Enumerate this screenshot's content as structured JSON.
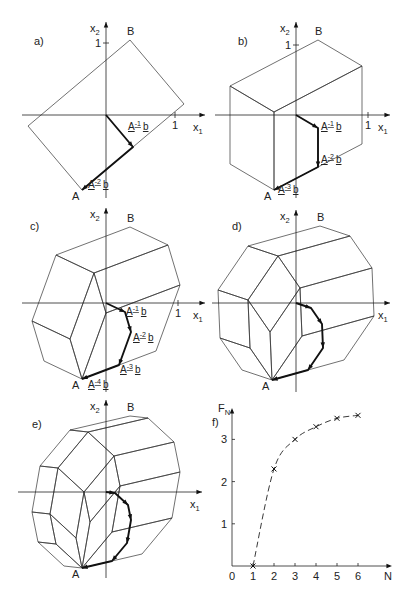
{
  "figure": {
    "panels": [
      {
        "id": "a",
        "label": "a)",
        "origin": [
          106,
          115
        ],
        "label_pos": [
          34,
          45
        ],
        "axes": {
          "xmin": 22,
          "xmax": 205,
          "ymin": 22,
          "ymax": 198,
          "x_label": "x1",
          "y_label": "x2",
          "tick_x": [
            175,
            "1"
          ],
          "tick_y": [
            43,
            "1"
          ]
        },
        "generators": [
          [
            27,
            32
          ],
          [
            -51,
            43
          ]
        ],
        "point_A": "A",
        "point_B": "B",
        "annotations": [
          {
            "text": "A",
            "sup": "-1",
            "tail": "b",
            "pos": [
              128,
              130
            ]
          },
          {
            "text": "A",
            "sup": "-2",
            "tail": "b",
            "pos": [
              88,
              188
            ]
          }
        ]
      },
      {
        "id": "b",
        "label": "b)",
        "origin": [
          296,
          115
        ],
        "label_pos": [
          238,
          45
        ],
        "axes": {
          "xmin": 215,
          "xmax": 390,
          "ymin": 22,
          "ymax": 198,
          "x_label": "x1",
          "y_label": "x2",
          "tick_x": [
            368,
            "1"
          ],
          "tick_y": [
            45,
            "1"
          ]
        },
        "generators": [
          [
            22,
            13
          ],
          [
            0,
            39
          ],
          [
            -44,
            23
          ]
        ],
        "point_A": "A",
        "point_B": "B",
        "annotations": [
          {
            "text": "A",
            "sup": "-1",
            "tail": "b",
            "pos": [
              321,
              130
            ]
          },
          {
            "text": "A",
            "sup": "-2",
            "tail": "b",
            "pos": [
              321,
              163
            ]
          },
          {
            "text": "A",
            "sup": "-3",
            "tail": "b",
            "pos": [
              278,
              193
            ]
          }
        ]
      },
      {
        "id": "c",
        "label": "c)",
        "origin": [
          106,
          303
        ],
        "label_pos": [
          30,
          230
        ],
        "axes": {
          "xmin": 22,
          "xmax": 205,
          "ymin": 208,
          "ymax": 392,
          "x_label": "x1",
          "y_label": "x2",
          "tick_x": [
            178,
            "1"
          ],
          "tick_y": null
        },
        "generators": [
          [
            19,
            9
          ],
          [
            6,
            20
          ],
          [
            -12,
            33
          ],
          [
            -37,
            14
          ]
        ],
        "point_A": "A",
        "point_B": "B",
        "annotations": [
          {
            "text": "A",
            "sup": "-1",
            "tail": "b",
            "pos": [
              126,
              315
            ]
          },
          {
            "text": "A",
            "sup": "-2",
            "tail": "b",
            "pos": [
              133,
              341
            ]
          },
          {
            "text": "A",
            "sup": "-3",
            "tail": "b",
            "pos": [
              120,
              373
            ]
          },
          {
            "text": "A",
            "sup": "-4",
            "tail": "b",
            "pos": [
              88,
              388
            ]
          }
        ]
      },
      {
        "id": "d",
        "label": "d)",
        "origin": [
          296,
          303
        ],
        "label_pos": [
          232,
          230
        ],
        "axes": {
          "xmin": 212,
          "xmax": 390,
          "ymin": 210,
          "ymax": 392,
          "x_label": "x1",
          "y_label": "x2",
          "tick_x": null,
          "tick_y": null
        },
        "generators": [
          [
            15,
            5
          ],
          [
            11,
            16
          ],
          [
            1,
            24
          ],
          [
            -15,
            22
          ],
          [
            -36,
            10
          ]
        ],
        "point_A": "A",
        "point_B": "B",
        "annotations": []
      },
      {
        "id": "e",
        "label": "e)",
        "origin": [
          106,
          492
        ],
        "label_pos": [
          32,
          428
        ],
        "axes": {
          "xmin": 18,
          "xmax": 202,
          "ymin": 400,
          "ymax": 578,
          "x_label": "x1",
          "y_label": "x2",
          "tick_x": null,
          "tick_y": null
        },
        "generators": [
          [
            9,
            1
          ],
          [
            13,
            12
          ],
          [
            3,
            15
          ],
          [
            -4,
            23
          ],
          [
            -15,
            18
          ],
          [
            -30,
            7
          ]
        ],
        "point_A": "A",
        "point_B": "B",
        "annotations": []
      }
    ]
  },
  "chart_data": {
    "type": "line",
    "panel_label": "f)",
    "title": "",
    "xlabel": "N",
    "ylabel": "F_N",
    "x": [
      1,
      2,
      3,
      4,
      5,
      6
    ],
    "values": [
      0,
      2.3,
      3.0,
      3.3,
      3.5,
      3.57
    ],
    "x_ticks": [
      "0",
      "1",
      "2",
      "3",
      "4",
      "5",
      "6"
    ],
    "y_ticks": [
      "1",
      "2",
      "3"
    ],
    "xlim": [
      0,
      7
    ],
    "ylim": [
      0,
      3.8
    ],
    "marker": "x",
    "line_style": "dashed",
    "grid": false
  }
}
